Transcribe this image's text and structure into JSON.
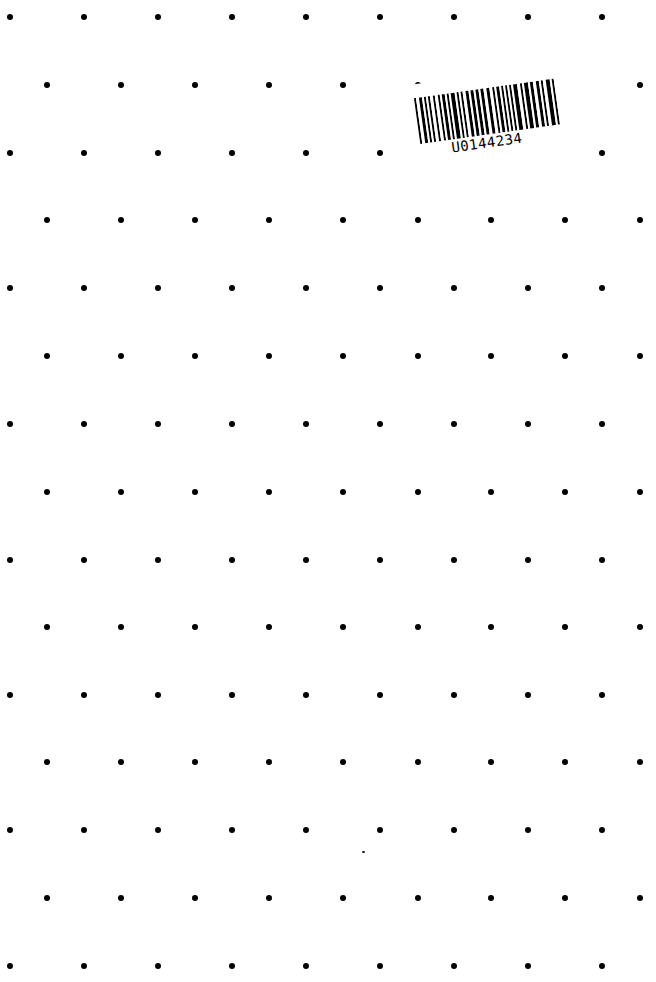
{
  "page": {
    "type": "dot-grid-paper",
    "background_color": "#ffffff",
    "dot_color": "#000000"
  },
  "dot_grid": {
    "rows": [
      17,
      85,
      153,
      220,
      288,
      356,
      424,
      492,
      560,
      627,
      695,
      762,
      830,
      898,
      966
    ],
    "even_row_x": [
      10,
      84,
      158,
      232,
      306,
      380,
      454,
      528,
      602
    ],
    "odd_row_x": [
      47,
      121,
      195,
      269,
      343,
      418,
      491,
      565,
      640
    ],
    "hidden_by_sticker": [
      [
        1,
        491
      ],
      [
        1,
        565
      ],
      [
        2,
        454
      ],
      [
        2,
        528
      ]
    ]
  },
  "barcode": {
    "text": "U0144234",
    "rotation_deg": -8
  },
  "specks": [
    [
      362,
      851
    ]
  ]
}
